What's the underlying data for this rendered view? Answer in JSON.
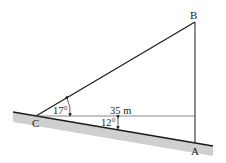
{
  "diagram": {
    "points": {
      "A": {
        "label": "A"
      },
      "B": {
        "label": "B"
      },
      "C": {
        "label": "C"
      }
    },
    "measurements": {
      "distance_label": "35 m",
      "angle_elevation": "17°",
      "angle_slope": "12°"
    },
    "colors": {
      "line": "#1a1a1a",
      "ground_fill": "#cfcfcf",
      "background": "#ffffff"
    }
  }
}
